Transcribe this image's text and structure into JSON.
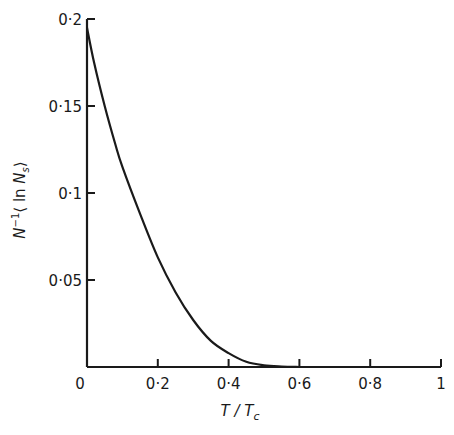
{
  "chart_data": {
    "type": "line",
    "title": "",
    "xlabel": "T / T_c",
    "ylabel": "N^-1 ⟨ln N_s⟩",
    "xlim": [
      0,
      1
    ],
    "ylim": [
      0,
      0.2
    ],
    "grid": false,
    "legend": null,
    "x_ticks": [
      0,
      0.2,
      0.4,
      0.6,
      0.8,
      1
    ],
    "x_tick_labels": [
      "0",
      "0·2",
      "0·4",
      "0·6",
      "0·8",
      "1"
    ],
    "y_ticks": [
      0.05,
      0.1,
      0.15,
      0.2
    ],
    "y_tick_labels": [
      "0·05",
      "0·1",
      "0·15",
      "0·2"
    ],
    "series": [
      {
        "name": "N^-1 <ln N_s>",
        "x": [
          0.0,
          0.02,
          0.05,
          0.08,
          0.1,
          0.15,
          0.2,
          0.25,
          0.3,
          0.35,
          0.4,
          0.45,
          0.5,
          0.55,
          0.6
        ],
        "values": [
          0.195,
          0.175,
          0.15,
          0.128,
          0.115,
          0.088,
          0.063,
          0.043,
          0.027,
          0.015,
          0.008,
          0.003,
          0.001,
          0.0003,
          0.0
        ]
      }
    ]
  },
  "labels": {
    "x_axis": {
      "main": "T / T",
      "sub": "c"
    },
    "y_axis": {
      "n": "N",
      "exp": "−1",
      "open": "⟨ ln ",
      "ns": "N",
      "ns_sub": "s",
      "close": "⟩"
    }
  }
}
